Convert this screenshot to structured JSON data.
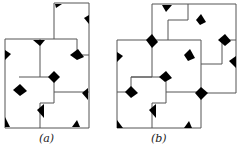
{
  "figures": [
    {
      "id": "a",
      "label": "(a)"
    },
    {
      "id": "b",
      "label": "(b)"
    }
  ],
  "colors": {
    "edge": "#555555",
    "shade": "#c8c8c8",
    "spike": "#000000"
  }
}
